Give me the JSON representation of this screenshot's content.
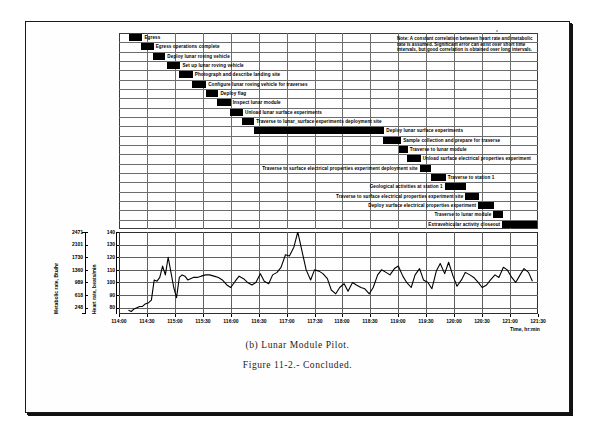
{
  "figure": {
    "caption_a": "(b) Lunar Module Pilot.",
    "caption_b": "Figure 11-2.- Concluded."
  },
  "note": {
    "text": "Note:  A constant correlation between heart rate and metabolic rate is assumed.  Significant error can exist over short time intervals, but good correlation is obtained over long intervals."
  },
  "gantt": {
    "time_start": "114:00",
    "time_end": "121:30",
    "tasks": [
      {
        "label": "Egress",
        "start": 114.18,
        "end": 114.42,
        "label_side": "right"
      },
      {
        "label": "Egress operations complete",
        "start": 114.4,
        "end": 114.62,
        "label_side": "right"
      },
      {
        "label": "Deploy lunar roving vehicle",
        "start": 114.6,
        "end": 114.83,
        "label_side": "right"
      },
      {
        "label": "Set up lunar roving vehicle",
        "start": 114.86,
        "end": 115.1,
        "label_side": "right"
      },
      {
        "label": "Photograph and describe landing site",
        "start": 115.08,
        "end": 115.32,
        "label_side": "right"
      },
      {
        "label": "Configure lunar roving vehicle for traverses",
        "start": 115.3,
        "end": 115.56,
        "label_side": "right"
      },
      {
        "label": "Deploy flag",
        "start": 115.55,
        "end": 115.78,
        "label_side": "right"
      },
      {
        "label": "Inspect lunar module",
        "start": 115.76,
        "end": 116.0,
        "label_side": "right"
      },
      {
        "label": "Unload lunar surface experiments",
        "start": 115.99,
        "end": 116.22,
        "label_side": "right"
      },
      {
        "label": "Traverse to lunar_surface experiments deployment site",
        "start": 116.21,
        "end": 116.42,
        "label_side": "right"
      },
      {
        "label": "Deploy lunar surface experiments",
        "start": 116.42,
        "end": 118.75,
        "label_side": "right"
      },
      {
        "label": "Sample collection and prepare for traverse",
        "start": 118.72,
        "end": 119.05,
        "label_side": "right"
      },
      {
        "label": "Traverse to lunar module",
        "start": 119.02,
        "end": 119.17,
        "label_side": "right"
      },
      {
        "label": "Unload surface electrical properties experiment",
        "start": 119.16,
        "end": 119.4,
        "label_side": "right"
      },
      {
        "label": "Traverse to surface electrical properties experiment deployment site",
        "start": 119.38,
        "end": 119.58,
        "label_side": "left"
      },
      {
        "label": "Traverse to station 1",
        "start": 119.58,
        "end": 119.85,
        "label_side": "right"
      },
      {
        "label": "Geological activities at station 1",
        "start": 119.83,
        "end": 120.22,
        "label_side": "left"
      },
      {
        "label": "Traverse to surface electrical properties experiment site",
        "start": 120.2,
        "end": 120.45,
        "label_side": "left"
      },
      {
        "label": "Deploy surface electrical properties experiment",
        "start": 120.43,
        "end": 120.72,
        "label_side": "left"
      },
      {
        "label": "Traverse to lunar module",
        "start": 120.7,
        "end": 120.88,
        "label_side": "left"
      },
      {
        "label": "Extravehicular activity closeout",
        "start": 120.86,
        "end": 121.48,
        "label_side": "left"
      }
    ]
  },
  "chart_data": {
    "type": "line",
    "title": "",
    "xlabel": "Time, hr:min",
    "ylabel": "Heart rate, beats/min",
    "ylabel_secondary": "Metabolic rate, Btu/hr",
    "xlim": [
      114.0,
      121.5
    ],
    "ylim": [
      75,
      140
    ],
    "grid": true,
    "legend": "none",
    "xticks": [
      "114:00",
      "114:30",
      "115:00",
      "115:30",
      "116:00",
      "116:30",
      "117:00",
      "117:30",
      "118:00",
      "118:30",
      "119:00",
      "119:30",
      "120:00",
      "120:30",
      "121:00",
      "121:30"
    ],
    "yticks_heart_rate": [
      140,
      130,
      120,
      110,
      100,
      90,
      80
    ],
    "yticks_metabolic_rate": [
      2471,
      2101,
      1730,
      1360,
      989,
      618,
      248
    ],
    "series": [
      {
        "name": "Heart rate",
        "x": [
          114.17,
          114.22,
          114.27,
          114.32,
          114.37,
          114.42,
          114.47,
          114.53,
          114.58,
          114.63,
          114.68,
          114.73,
          114.78,
          114.83,
          114.88,
          114.93,
          114.98,
          115.03,
          115.08,
          115.13,
          115.18,
          115.23,
          115.28,
          115.33,
          115.4,
          115.47,
          115.55,
          115.62,
          115.7,
          115.78,
          115.85,
          115.93,
          116.0,
          116.08,
          116.15,
          116.23,
          116.3,
          116.38,
          116.45,
          116.53,
          116.6,
          116.68,
          116.75,
          116.83,
          116.9,
          116.98,
          117.05,
          117.13,
          117.2,
          117.28,
          117.35,
          117.43,
          117.5,
          117.58,
          117.65,
          117.73,
          117.8,
          117.88,
          117.95,
          118.03,
          118.1,
          118.18,
          118.25,
          118.33,
          118.4,
          118.48,
          118.55,
          118.63,
          118.7,
          118.78,
          118.85,
          118.93,
          119.0,
          119.08,
          119.15,
          119.23,
          119.3,
          119.38,
          119.45,
          119.53,
          119.6,
          119.68,
          119.75,
          119.83,
          119.9,
          119.98,
          120.05,
          120.13,
          120.2,
          120.28,
          120.35,
          120.43,
          120.5,
          120.58,
          120.65,
          120.73,
          120.8,
          120.88,
          120.95,
          121.03,
          121.1,
          121.18,
          121.25,
          121.33,
          121.4
        ],
        "y": [
          78,
          77,
          79,
          80,
          81,
          81,
          83,
          84,
          86,
          102,
          101,
          104,
          113,
          106,
          120,
          108,
          96,
          88,
          104,
          106,
          105,
          102,
          103,
          104,
          104,
          105,
          106,
          106,
          105,
          104,
          102,
          98,
          96,
          101,
          105,
          103,
          100,
          98,
          100,
          107,
          101,
          99,
          106,
          108,
          112,
          122,
          121,
          128,
          140,
          124,
          110,
          102,
          110,
          109,
          107,
          103,
          94,
          91,
          96,
          99,
          93,
          100,
          98,
          96,
          95,
          91,
          96,
          106,
          110,
          108,
          106,
          111,
          113,
          105,
          100,
          96,
          106,
          111,
          102,
          100,
          95,
          109,
          115,
          107,
          116,
          105,
          97,
          102,
          108,
          106,
          104,
          100,
          96,
          98,
          102,
          106,
          104,
          112,
          110,
          104,
          100,
          106,
          111,
          108,
          101
        ]
      }
    ]
  }
}
